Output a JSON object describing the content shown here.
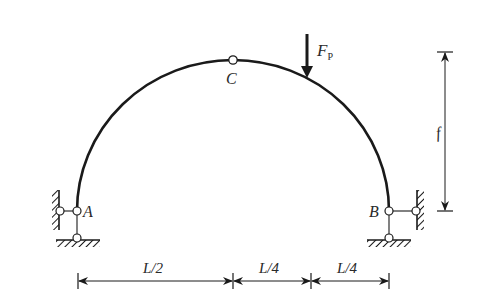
{
  "diagram": {
    "type": "three-hinged arch",
    "colors": {
      "line": "#1a1a1a",
      "text": "#2a2a2a",
      "background": "#ffffff"
    },
    "nodes": {
      "A": {
        "label": "A"
      },
      "B": {
        "label": "B"
      },
      "C": {
        "label": "C"
      }
    },
    "load": {
      "label_main": "F",
      "label_sub": "P",
      "direction": "down"
    },
    "dimensions": {
      "rise": {
        "label": "f"
      },
      "spans": [
        {
          "label": "L/2"
        },
        {
          "label": "L/4"
        },
        {
          "label": "L/4"
        }
      ]
    }
  }
}
